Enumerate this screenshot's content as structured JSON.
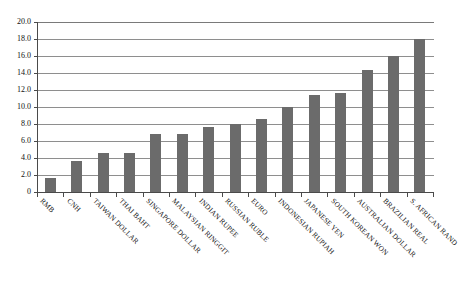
{
  "chart_data": {
    "type": "bar",
    "title": "",
    "xlabel": "",
    "ylabel": "",
    "ylim": [
      0,
      20
    ],
    "grid": true,
    "legend": "none",
    "bar_color": "#6b6b6b",
    "categories": [
      "RMB",
      "CNH",
      "TAIWAN DOLLAR",
      "THAI BAHT",
      "SINGAPORE DOLLAR",
      "MALAYSIAN RINGGIT",
      "INDIAN RUPEE",
      "RUSSIAN RUBLE",
      "EURO",
      "INDONESIAN RUPIAH",
      "JAPANESE YEN",
      "SOUTH KOREAN WON",
      "AUSTRALIAN DOLLAR",
      "BRAZILIAN REAL",
      "S. AFRICAN RAND"
    ],
    "values": [
      1.6,
      3.6,
      4.6,
      4.6,
      6.8,
      6.8,
      7.6,
      8.0,
      8.6,
      10.0,
      11.4,
      11.6,
      14.4,
      16.0,
      18.0
    ],
    "ytick_labels": [
      "0",
      "2.0",
      "4.0",
      "6.0",
      "8.0",
      "10.0",
      "12.0",
      "14.0",
      "16.0",
      "18.0",
      "20.0"
    ],
    "ytick_values": [
      0,
      2,
      4,
      6,
      8,
      10,
      12,
      14,
      16,
      18,
      20
    ]
  }
}
